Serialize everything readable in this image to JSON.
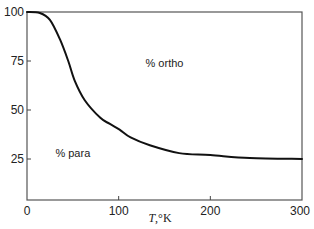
{
  "chart_data": {
    "type": "line",
    "title": "",
    "xlabel": "T,°K",
    "ylabel": "",
    "xlim": [
      0,
      300
    ],
    "ylim": [
      4,
      100
    ],
    "grid": false,
    "x_ticks": [
      0,
      100,
      200,
      300
    ],
    "x_tick_labels": [
      "0",
      "100",
      "200",
      "300"
    ],
    "y_ticks": [
      25,
      50,
      75,
      100
    ],
    "y_tick_labels": [
      "25",
      "50",
      "75",
      "100"
    ],
    "series": [
      {
        "name": "% ortho hydrogen vs temperature",
        "x": [
          0,
          14,
          25,
          36,
          45,
          52,
          63,
          80,
          90,
          101,
          113,
          134,
          166,
          200,
          243,
          300
        ],
        "y": [
          100,
          99.5,
          96,
          86,
          75,
          65,
          55,
          46,
          43,
          40,
          36,
          32,
          28,
          27,
          25.5,
          25
        ]
      }
    ],
    "annotations": [
      {
        "text": "% ortho",
        "x": 150,
        "y": 72
      },
      {
        "text": "% para",
        "x": 50,
        "y": 26
      }
    ]
  }
}
